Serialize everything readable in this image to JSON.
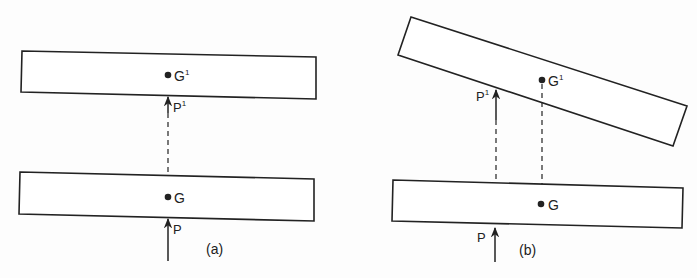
{
  "figure_a": {
    "caption": "(a)",
    "top_point": "G",
    "top_sup": "1",
    "top_force": "P",
    "top_force_sup": "1",
    "bottom_point": "G",
    "bottom_force": "P"
  },
  "figure_b": {
    "caption": "(b)",
    "top_point": "G",
    "top_sup": "1",
    "top_force": "P",
    "top_force_sup": "1",
    "bottom_point": "G",
    "bottom_force": "P"
  },
  "colors": {
    "stroke": "#222222",
    "background": "#fdfdfd"
  }
}
